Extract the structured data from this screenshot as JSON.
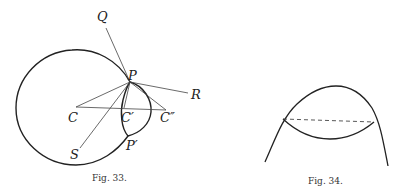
{
  "figures": [
    {
      "id": "fig33",
      "caption": "Fig. 33.",
      "labels": {
        "Q": "Q",
        "P": "P",
        "R": "R",
        "C": "C",
        "C1": "C′",
        "C2": "C″",
        "S": "S",
        "P1": "P′"
      }
    },
    {
      "id": "fig34",
      "caption": "Fig. 34."
    }
  ],
  "colors": {
    "stroke": "#222222",
    "thin": "#444444"
  }
}
